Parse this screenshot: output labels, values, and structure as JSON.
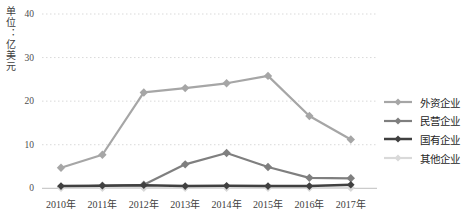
{
  "chart_data": {
    "type": "line",
    "title": "",
    "xlabel": "",
    "ylabel": "单位：亿美元",
    "categories": [
      "2010年",
      "2011年",
      "2012年",
      "2013年",
      "2014年",
      "2015年",
      "2016年",
      "2017年"
    ],
    "y_ticks": [
      0,
      10,
      20,
      30,
      40
    ],
    "ylim": [
      0,
      40
    ],
    "grid": "horizontal-dashed",
    "legend_position": "right",
    "grid_color": "#d9d9d9",
    "axis_color": "#bfbfbf",
    "text_color": "#404040",
    "series": [
      {
        "key": "foreign-enterprises",
        "name": "外资企业",
        "color": "#a6a6a6",
        "marker": "diamond",
        "values": [
          4.7,
          7.7,
          22.0,
          23.0,
          24.1,
          25.8,
          16.6,
          11.2
        ]
      },
      {
        "key": "private-enterprises",
        "name": "民营企业",
        "color": "#7f7f7f",
        "marker": "diamond",
        "values": [
          0.3,
          0.6,
          0.8,
          5.5,
          8.1,
          4.9,
          2.4,
          2.3
        ]
      },
      {
        "key": "state-owned-enterprises",
        "name": "国有企业",
        "color": "#404040",
        "marker": "diamond",
        "values": [
          0.5,
          0.6,
          0.7,
          0.5,
          0.6,
          0.5,
          0.5,
          0.8
        ]
      },
      {
        "key": "other-enterprises",
        "name": "其他企业",
        "color": "#d9d9d9",
        "marker": "diamond",
        "values": [
          0.1,
          0.1,
          0.1,
          0.1,
          0.1,
          0.1,
          0.1,
          0.1
        ]
      }
    ]
  }
}
